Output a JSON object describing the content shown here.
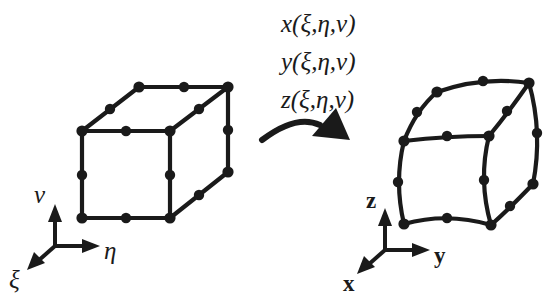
{
  "figure": {
    "background_color": "#ffffff",
    "ink_color": "#1a1a1a"
  },
  "mapping_functions": {
    "lines": [
      "x(ξ,η,ν)",
      "y(ξ,η,ν)",
      "z(ξ,η,ν)"
    ],
    "line_x": "x(ξ,η,ν)",
    "line_y": "y(ξ,η,ν)",
    "line_z": "z(ξ,η,ν)"
  },
  "arrow": {
    "name": "mapping-arrow",
    "direction": "left-to-right, curving upward",
    "head_shape": "solid-triangle"
  },
  "left_element": {
    "name": "reference-element",
    "shape": "straight-edged cube",
    "node_count": 20,
    "description": "Undeformed parent cube in natural coordinates"
  },
  "right_element": {
    "name": "physical-element",
    "shape": "curved-edge distorted hexahedron",
    "node_count": 20,
    "description": "Mapped curvilinear element in physical coordinates"
  },
  "left_axes": {
    "name": "natural-coordinate-triad",
    "up": "ν",
    "right": "η",
    "out": "ξ",
    "labels": [
      "ν",
      "η",
      "ξ"
    ]
  },
  "right_axes": {
    "name": "physical-coordinate-triad",
    "up": "z",
    "right": "y",
    "out": "x",
    "labels": [
      "z",
      "y",
      "x"
    ]
  }
}
